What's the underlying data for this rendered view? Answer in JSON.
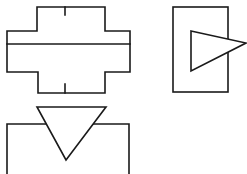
{
  "diagram": {
    "canvas": {
      "width": 247,
      "height": 174,
      "background": "#ffffff",
      "stroke_color": "#1a1a1a"
    },
    "shapes": [
      {
        "id": "cross-shape",
        "type": "cross-outline",
        "outline_points": "37,7 105,7 105,31 130,31 130,72 105,72 105,93 38,93 38,72 7,72 7,31 37,31",
        "divider": {
          "x1": 7,
          "y1": 44,
          "x2": 130,
          "y2": 44
        },
        "top_tick": {
          "x1": 65,
          "y1": 7,
          "x2": 65,
          "y2": 15
        },
        "bottom_tick": {
          "x1": 65,
          "y1": 84,
          "x2": 65,
          "y2": 93
        }
      },
      {
        "id": "rect-with-right-triangle",
        "type": "rectangle-with-triangle",
        "rect": {
          "x": 173,
          "y": 7,
          "width": 55,
          "height": 85
        },
        "triangle_points": "191,31 246,43 191,71"
      },
      {
        "id": "open-box-with-down-triangle",
        "type": "open-box-with-triangle",
        "box_path": "M7,174 L7,124 L129,124 L129,174",
        "triangle_points": "37,107 106,107 66,160"
      }
    ]
  }
}
